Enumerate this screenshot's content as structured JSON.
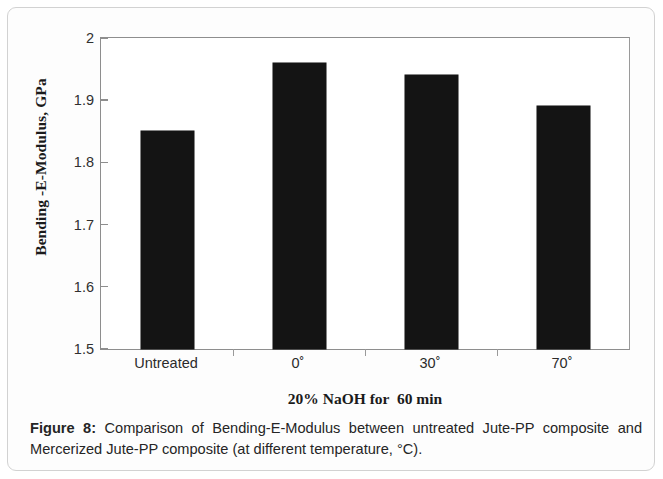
{
  "figure": {
    "caption_label": "Figure 8:",
    "caption_text": " Comparison of Bending-E-Modulus between untreated Jute-PP composite and Mercerized Jute-PP composite (at different temperature, °C)."
  },
  "chart_data": {
    "type": "bar",
    "title": "",
    "categories": [
      "Untreated",
      "0˚",
      "30˚",
      "70˚"
    ],
    "values": [
      1.85,
      1.96,
      1.94,
      1.89
    ],
    "xlabel": "20% NaOH for  60 min",
    "ylabel": "Bending -E-Modulus, GPa",
    "ylim": [
      1.5,
      2
    ],
    "ytick_labels": [
      "2",
      "1.9",
      "1.8",
      "1.7",
      "1.6",
      "1.5"
    ],
    "ytick_values": [
      2,
      1.9,
      1.8,
      1.7,
      1.6,
      1.5
    ],
    "grid": false,
    "legend": false,
    "bar_color": "#141414",
    "axis_color": "#8e8e8e",
    "plot_background": "#ffffff"
  }
}
